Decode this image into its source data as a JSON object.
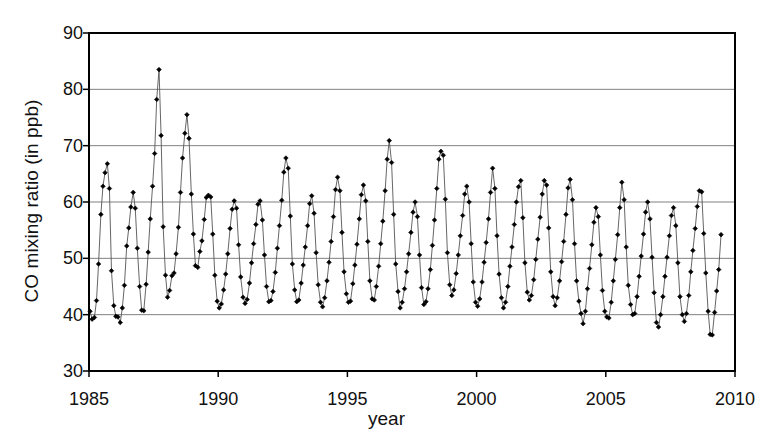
{
  "chart_data": {
    "type": "line",
    "title": "",
    "subtitle": "",
    "xlabel": "year",
    "ylabel": "CO mixing ratio (in ppb)",
    "xlim": [
      1985,
      2010
    ],
    "ylim": [
      30,
      90
    ],
    "xticks": [
      1985,
      1990,
      1995,
      2000,
      2005,
      2010
    ],
    "yticks": [
      30,
      40,
      50,
      60,
      70,
      80,
      90
    ],
    "grid": "horizontal",
    "legend": "none",
    "marker": "diamond",
    "marker_color": "#000000",
    "line_color": "#555555",
    "series": [
      {
        "name": "CO mixing ratio",
        "x": [
          1985.04,
          1985.12,
          1985.21,
          1985.29,
          1985.37,
          1985.46,
          1985.54,
          1985.62,
          1985.71,
          1985.79,
          1985.87,
          1985.96,
          1986.04,
          1986.12,
          1986.21,
          1986.29,
          1986.37,
          1986.46,
          1986.54,
          1986.62,
          1986.71,
          1986.79,
          1986.87,
          1986.96,
          1987.04,
          1987.12,
          1987.21,
          1987.29,
          1987.37,
          1987.46,
          1987.54,
          1987.62,
          1987.71,
          1987.79,
          1987.87,
          1987.96,
          1988.04,
          1988.12,
          1988.21,
          1988.29,
          1988.37,
          1988.46,
          1988.54,
          1988.62,
          1988.71,
          1988.79,
          1988.87,
          1988.96,
          1989.04,
          1989.12,
          1989.21,
          1989.29,
          1989.37,
          1989.46,
          1989.54,
          1989.62,
          1989.71,
          1989.79,
          1989.87,
          1989.96,
          1990.04,
          1990.12,
          1990.21,
          1990.29,
          1990.37,
          1990.46,
          1990.54,
          1990.62,
          1990.71,
          1990.79,
          1990.87,
          1990.96,
          1991.04,
          1991.12,
          1991.21,
          1991.29,
          1991.37,
          1991.46,
          1991.54,
          1991.62,
          1991.71,
          1991.79,
          1991.87,
          1991.96,
          1992.04,
          1992.12,
          1992.21,
          1992.29,
          1992.37,
          1992.46,
          1992.54,
          1992.62,
          1992.71,
          1992.79,
          1992.87,
          1992.96,
          1993.04,
          1993.12,
          1993.21,
          1993.29,
          1993.37,
          1993.46,
          1993.54,
          1993.62,
          1993.71,
          1993.79,
          1993.87,
          1993.96,
          1994.04,
          1994.12,
          1994.21,
          1994.29,
          1994.37,
          1994.46,
          1994.54,
          1994.62,
          1994.71,
          1994.79,
          1994.87,
          1994.96,
          1995.04,
          1995.12,
          1995.21,
          1995.29,
          1995.37,
          1995.46,
          1995.54,
          1995.62,
          1995.71,
          1995.79,
          1995.87,
          1995.96,
          1996.04,
          1996.12,
          1996.21,
          1996.29,
          1996.37,
          1996.46,
          1996.54,
          1996.62,
          1996.71,
          1996.79,
          1996.87,
          1996.96,
          1997.04,
          1997.12,
          1997.21,
          1997.29,
          1997.37,
          1997.46,
          1997.54,
          1997.62,
          1997.71,
          1997.79,
          1997.87,
          1997.96,
          1998.04,
          1998.12,
          1998.21,
          1998.29,
          1998.37,
          1998.46,
          1998.54,
          1998.62,
          1998.71,
          1998.79,
          1998.87,
          1998.96,
          1999.04,
          1999.12,
          1999.21,
          1999.29,
          1999.37,
          1999.46,
          1999.54,
          1999.62,
          1999.71,
          1999.79,
          1999.87,
          1999.96,
          2000.04,
          2000.12,
          2000.21,
          2000.29,
          2000.37,
          2000.46,
          2000.54,
          2000.62,
          2000.71,
          2000.79,
          2000.87,
          2000.96,
          2001.04,
          2001.12,
          2001.21,
          2001.29,
          2001.37,
          2001.46,
          2001.54,
          2001.62,
          2001.71,
          2001.79,
          2001.87,
          2001.96,
          2002.04,
          2002.12,
          2002.21,
          2002.29,
          2002.37,
          2002.46,
          2002.54,
          2002.62,
          2002.71,
          2002.79,
          2002.87,
          2002.96,
          2003.04,
          2003.12,
          2003.21,
          2003.29,
          2003.37,
          2003.46,
          2003.54,
          2003.62,
          2003.71,
          2003.79,
          2003.87,
          2003.96,
          2004.04,
          2004.12,
          2004.21,
          2004.29,
          2004.37,
          2004.46,
          2004.54,
          2004.62,
          2004.71,
          2004.79,
          2004.87,
          2004.96,
          2005.04,
          2005.12,
          2005.21,
          2005.29,
          2005.37,
          2005.46,
          2005.54,
          2005.62,
          2005.71,
          2005.79,
          2005.87,
          2005.96,
          2006.04,
          2006.12,
          2006.21,
          2006.29,
          2006.37,
          2006.46,
          2006.54,
          2006.62,
          2006.71,
          2006.79,
          2006.87,
          2006.96,
          2007.04,
          2007.12,
          2007.21,
          2007.29,
          2007.37,
          2007.46,
          2007.54,
          2007.62,
          2007.71,
          2007.79,
          2007.87,
          2007.96,
          2008.04,
          2008.12,
          2008.21,
          2008.29,
          2008.37,
          2008.46,
          2008.54,
          2008.62,
          2008.71,
          2008.79,
          2008.87,
          2008.96,
          2009.04,
          2009.12,
          2009.21,
          2009.29,
          2009.37,
          2009.46
        ],
        "y": [
          40.6,
          39.2,
          39.5,
          42.5,
          49.0,
          57.8,
          62.8,
          65.2,
          66.8,
          62.4,
          47.8,
          41.6,
          39.7,
          39.6,
          38.6,
          41.2,
          45.2,
          52.2,
          55.4,
          59.1,
          61.7,
          58.9,
          51.8,
          45.0,
          40.8,
          40.7,
          45.4,
          51.1,
          57.0,
          62.8,
          68.6,
          78.2,
          83.5,
          71.8,
          55.6,
          47.0,
          43.1,
          44.3,
          46.9,
          47.4,
          50.8,
          55.5,
          61.7,
          67.8,
          72.2,
          75.5,
          71.3,
          61.4,
          54.3,
          48.7,
          48.4,
          51.2,
          53.1,
          56.9,
          60.8,
          61.2,
          60.9,
          54.3,
          47.0,
          42.4,
          41.2,
          41.9,
          44.4,
          47.2,
          50.8,
          55.3,
          58.7,
          60.2,
          58.9,
          52.4,
          46.7,
          43.1,
          42.0,
          42.7,
          45.6,
          49.2,
          52.6,
          56.0,
          59.6,
          60.2,
          56.8,
          50.6,
          45.0,
          42.3,
          42.5,
          44.1,
          47.5,
          51.8,
          55.8,
          60.3,
          65.3,
          67.8,
          66.0,
          57.5,
          49.0,
          44.4,
          42.3,
          42.6,
          45.6,
          48.8,
          52.0,
          55.8,
          59.7,
          61.1,
          58.0,
          51.0,
          45.3,
          42.2,
          41.4,
          43.0,
          46.0,
          49.3,
          53.0,
          57.4,
          62.2,
          64.4,
          62.0,
          54.6,
          47.6,
          43.7,
          42.2,
          42.4,
          45.5,
          48.8,
          52.5,
          57.0,
          61.3,
          63.0,
          60.2,
          53.0,
          46.0,
          42.8,
          42.6,
          45.0,
          48.6,
          52.6,
          56.6,
          62.0,
          67.6,
          70.9,
          67.0,
          57.8,
          49.0,
          44.1,
          41.2,
          42.2,
          44.6,
          47.6,
          50.8,
          54.6,
          58.2,
          60.0,
          57.4,
          50.6,
          44.8,
          41.8,
          42.3,
          44.6,
          48.0,
          52.3,
          56.8,
          62.4,
          67.6,
          69.0,
          68.3,
          60.5,
          51.0,
          45.3,
          43.4,
          44.4,
          47.3,
          50.6,
          54.0,
          57.6,
          61.4,
          62.8,
          60.0,
          52.6,
          45.8,
          42.2,
          41.5,
          42.8,
          45.8,
          49.3,
          52.8,
          57.0,
          61.7,
          66.0,
          62.4,
          54.0,
          47.2,
          43.0,
          41.2,
          42.2,
          45.0,
          48.6,
          52.0,
          56.0,
          60.0,
          62.7,
          63.8,
          57.2,
          49.2,
          44.0,
          42.6,
          43.4,
          46.2,
          49.8,
          53.4,
          57.3,
          61.4,
          63.8,
          63.0,
          55.4,
          47.6,
          43.2,
          41.6,
          43.0,
          46.0,
          49.4,
          53.0,
          57.8,
          62.5,
          64.0,
          60.4,
          52.6,
          46.0,
          42.4,
          40.2,
          38.4,
          40.6,
          44.6,
          48.2,
          52.4,
          56.4,
          59.0,
          57.4,
          50.6,
          44.3,
          40.6,
          39.6,
          39.4,
          42.2,
          46.0,
          49.8,
          54.2,
          59.0,
          63.5,
          60.4,
          52.0,
          45.2,
          41.8,
          40.0,
          40.2,
          43.2,
          46.8,
          50.4,
          54.3,
          58.2,
          60.0,
          57.0,
          50.2,
          43.9,
          38.6,
          37.8,
          40.0,
          43.2,
          46.8,
          50.2,
          54.0,
          57.6,
          59.0,
          55.8,
          49.2,
          43.2,
          40.0,
          38.8,
          40.2,
          43.4,
          47.6,
          51.4,
          55.3,
          59.2,
          62.0,
          61.8,
          54.4,
          47.4,
          40.6,
          36.5,
          36.4,
          40.4,
          44.2,
          48.0,
          54.2
        ]
      }
    ]
  },
  "axes": {
    "y_tick_labels": [
      "90",
      "80",
      "70",
      "60",
      "50",
      "40",
      "30"
    ],
    "x_tick_labels": [
      "1985",
      "1990",
      "1995",
      "2000",
      "2005",
      "2010"
    ],
    "x_axis_title": "year",
    "y_axis_title": "CO mixing ratio (in ppb)"
  },
  "style": {
    "plot_background": "#ffffff",
    "gridline_color": "#808080",
    "axis_color": "#000000",
    "marker_color": "#000000",
    "line_color": "#555555"
  }
}
